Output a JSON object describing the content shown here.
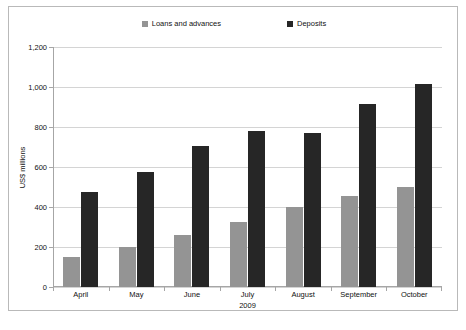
{
  "chart_data": {
    "type": "bar",
    "title": "",
    "subtitle": "",
    "categories": [
      "April",
      "May",
      "June",
      "July",
      "August",
      "September",
      "October"
    ],
    "series": [
      {
        "name": "Loans and advances",
        "color": "#949494",
        "values": [
          150,
          200,
          260,
          325,
          400,
          455,
          500
        ]
      },
      {
        "name": "Deposits",
        "color": "#262626",
        "values": [
          475,
          575,
          705,
          778,
          772,
          915,
          1015
        ]
      }
    ],
    "xlabel": "2009",
    "ylabel": "US$ millions",
    "ylim": [
      0,
      1200
    ],
    "ytick_values": [
      0,
      200,
      400,
      600,
      800,
      1000,
      1200
    ],
    "ytick_labels": [
      "0",
      "200",
      "400",
      "600",
      "800",
      "1,000",
      "1,200"
    ],
    "grid": "horizontal",
    "legend_position": "top-center",
    "legend_marker": "square"
  }
}
